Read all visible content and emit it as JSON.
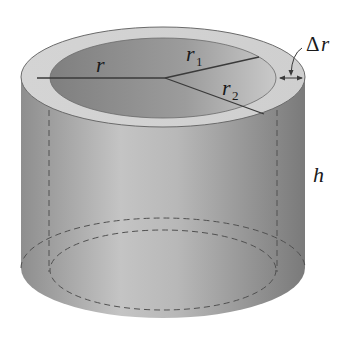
{
  "figure": {
    "labels": {
      "r": "r",
      "r1_main": "r",
      "r1_sub": "1",
      "r2_main": "r",
      "r2_sub": "2",
      "delta_symbol": "Δ",
      "delta_var": "r",
      "h": "h"
    },
    "colors": {
      "outer_wall": "#9a9a9a",
      "rim": "#d2d2d2",
      "inner_cavity": "#8c8c8c",
      "line": "#3a3a3a",
      "dashed": "#505050",
      "background": "#ffffff"
    }
  }
}
